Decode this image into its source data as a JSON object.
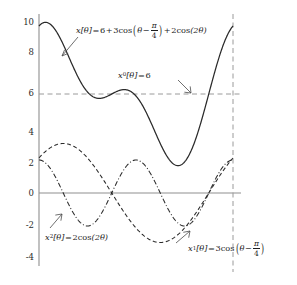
{
  "chart_data": {
    "type": "line",
    "title": "",
    "xlabel": "",
    "ylabel": "",
    "xlim": [
      0,
      6.283185307179586
    ],
    "ylim": [
      -4.6,
      10.8
    ],
    "grid": false,
    "legend_position": "inline-annotations",
    "x_axis_visible_ticks": [],
    "yticks": [
      10,
      8,
      6,
      4,
      2,
      0,
      -2,
      -4
    ],
    "ytick_labels": [
      "10",
      "8",
      "6",
      "4",
      "2",
      "0",
      "-2",
      "-4"
    ],
    "reference_lines": [
      {
        "name": "mean-level",
        "orientation": "horizontal",
        "value": 6,
        "style": "dashed"
      },
      {
        "name": "period-end",
        "orientation": "vertical",
        "value": 6.283185307179586,
        "style": "dashed"
      },
      {
        "name": "zero-axis",
        "orientation": "horizontal",
        "value": 0,
        "style": "solid"
      }
    ],
    "series": [
      {
        "name": "x",
        "expression": "6 + 3cos(theta - pi/4) + 2cos(2 theta)",
        "style": "solid",
        "color": "#2a2a2a",
        "key_points": {
          "start": 10.12,
          "max": 10.15,
          "local_min": 5.72,
          "local_max": 6.28,
          "global_min": 1.63,
          "end": 10.12
        }
      },
      {
        "name": "x1",
        "expression": "3cos(theta - pi/4)",
        "style": "dashed",
        "color": "#2a2a2a",
        "key_points": {
          "start": 2.12,
          "max": 3.0,
          "min": -3.0,
          "end": 2.12
        }
      },
      {
        "name": "x2",
        "expression": "2cos(2 theta)",
        "style": "dashdot",
        "color": "#2a2a2a",
        "key_points": {
          "start": 2.0,
          "max": 2.0,
          "min": -2.0,
          "end": 2.0
        }
      }
    ],
    "annotations": [
      {
        "id": "x-label",
        "series": "x",
        "text": "x[θ] = 6+3cos(θ − π/4) + 2cos(2θ)"
      },
      {
        "id": "x0-label",
        "series": "mean-level",
        "text": "x₀[θ] = 6"
      },
      {
        "id": "x2-label",
        "series": "x2",
        "text": "x₂[θ] = 2cos(2θ)"
      },
      {
        "id": "x1-label",
        "series": "x1",
        "text": "x₁[θ] = 3cos(θ − π/4)"
      }
    ]
  },
  "labels": {
    "ytick_10": "10",
    "ytick_8": "8",
    "ytick_6": "6",
    "ytick_4": "4",
    "ytick_2": "2",
    "ytick_0": "0",
    "ytick_neg2": "-2",
    "ytick_neg4": "-4"
  },
  "annotations": {
    "x_main": {
      "fn": "x",
      "arg": "[θ]",
      "eq": "=",
      "const": "6",
      "plus1": "+",
      "amp1": "3",
      "cos1": "cos",
      "inner_var": "θ",
      "minus": "−",
      "pi": "π",
      "four": "4",
      "plus2": "+",
      "amp2": "2",
      "cos2": "cos",
      "inner2": "(2θ)"
    },
    "x_mean": {
      "fn": "x",
      "sub": "0",
      "arg": "[θ]",
      "eq": "=",
      "value": "6"
    },
    "x_two": {
      "fn": "x",
      "sub": "2",
      "arg": "[θ]",
      "eq": "=",
      "amp": "2",
      "cos": "cos",
      "inner": "(2θ)"
    },
    "x_one": {
      "fn": "x",
      "sub": "1",
      "arg": "[θ]",
      "eq": "=",
      "amp": "3",
      "cos": "cos",
      "inner_var": "θ",
      "minus": "−",
      "pi": "π",
      "four": "4"
    }
  },
  "style": {
    "curve_color": "#2a2a2a",
    "axis_color": "#8a8a8a",
    "guide_color": "#9a9a9a",
    "text_color": "#1c1c1c",
    "background": "#ffffff"
  }
}
